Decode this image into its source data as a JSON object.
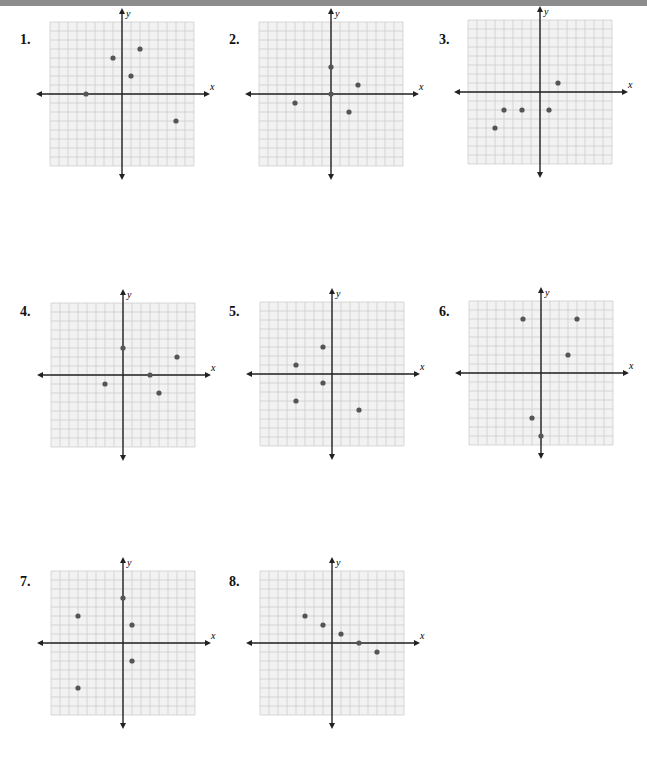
{
  "header": {
    "bar_color": "#8c8c8c"
  },
  "style": {
    "grid_color": "#c8c8c8",
    "grid_bg": "#f2f2f2",
    "axis_color": "#222222",
    "point_color": "#555555",
    "unit_px": 9
  },
  "axis_labels": {
    "x": "x",
    "y": "y"
  },
  "chart_data": [
    {
      "type": "scatter",
      "label": "1.",
      "xlim": [
        -8,
        8
      ],
      "ylim": [
        -8,
        8
      ],
      "grid": true,
      "points": [
        [
          -4,
          0
        ],
        [
          -1,
          4
        ],
        [
          2,
          5
        ],
        [
          1,
          2
        ],
        [
          6,
          -3
        ]
      ]
    },
    {
      "type": "scatter",
      "label": "2.",
      "xlim": [
        -8,
        8
      ],
      "ylim": [
        -8,
        8
      ],
      "grid": true,
      "points": [
        [
          0,
          0
        ],
        [
          0,
          3
        ],
        [
          3,
          1
        ],
        [
          -4,
          -1
        ],
        [
          2,
          -2
        ]
      ]
    },
    {
      "type": "scatter",
      "label": "3.",
      "xlim": [
        -8,
        8
      ],
      "ylim": [
        -8,
        8
      ],
      "grid": true,
      "points": [
        [
          2,
          1
        ],
        [
          -4,
          -2
        ],
        [
          -2,
          -2
        ],
        [
          1,
          -2
        ],
        [
          -5,
          -4
        ]
      ]
    },
    {
      "type": "scatter",
      "label": "4.",
      "xlim": [
        -8,
        8
      ],
      "ylim": [
        -8,
        8
      ],
      "grid": true,
      "points": [
        [
          0,
          3
        ],
        [
          6,
          2
        ],
        [
          3,
          0
        ],
        [
          -2,
          -1
        ],
        [
          4,
          -2
        ]
      ]
    },
    {
      "type": "scatter",
      "label": "5.",
      "xlim": [
        -8,
        8
      ],
      "ylim": [
        -8,
        8
      ],
      "grid": true,
      "points": [
        [
          -1,
          3
        ],
        [
          -4,
          1
        ],
        [
          -1,
          -1
        ],
        [
          -4,
          -3
        ],
        [
          3,
          -4
        ]
      ]
    },
    {
      "type": "scatter",
      "label": "6.",
      "xlim": [
        -8,
        8
      ],
      "ylim": [
        -8,
        8
      ],
      "grid": true,
      "points": [
        [
          -2,
          6
        ],
        [
          4,
          6
        ],
        [
          3,
          2
        ],
        [
          -1,
          -5
        ],
        [
          0,
          -7
        ]
      ]
    },
    {
      "type": "scatter",
      "label": "7.",
      "xlim": [
        -8,
        8
      ],
      "ylim": [
        -8,
        8
      ],
      "grid": true,
      "points": [
        [
          0,
          5
        ],
        [
          -5,
          3
        ],
        [
          1,
          2
        ],
        [
          1,
          -2
        ],
        [
          -5,
          -5
        ]
      ]
    },
    {
      "type": "scatter",
      "label": "8.",
      "xlim": [
        -8,
        8
      ],
      "ylim": [
        -8,
        8
      ],
      "grid": true,
      "points": [
        [
          -3,
          3
        ],
        [
          -1,
          2
        ],
        [
          1,
          1
        ],
        [
          3,
          0
        ],
        [
          5,
          -1
        ]
      ]
    }
  ],
  "layout": [
    {
      "num_x": 20,
      "num_y": 32,
      "ox": 122,
      "oy": 94
    },
    {
      "num_x": 229,
      "num_y": 32,
      "ox": 331,
      "oy": 94
    },
    {
      "num_x": 439,
      "num_y": 32,
      "ox": 540,
      "oy": 92
    },
    {
      "num_x": 20,
      "num_y": 304,
      "ox": 123,
      "oy": 375
    },
    {
      "num_x": 229,
      "num_y": 304,
      "ox": 332,
      "oy": 374
    },
    {
      "num_x": 439,
      "num_y": 304,
      "ox": 541,
      "oy": 373
    },
    {
      "num_x": 20,
      "num_y": 574,
      "ox": 123,
      "oy": 643
    },
    {
      "num_x": 229,
      "num_y": 574,
      "ox": 332,
      "oy": 643
    }
  ]
}
